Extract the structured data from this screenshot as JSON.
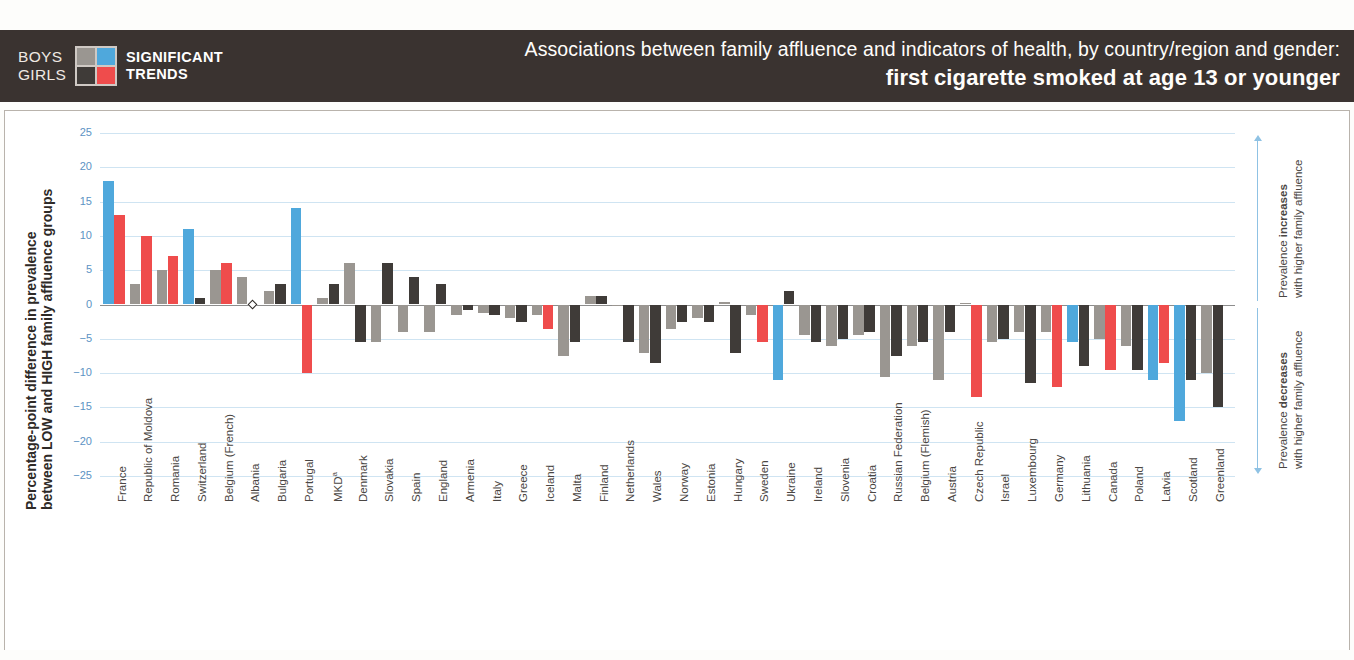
{
  "header": {
    "legend": {
      "boys_label": "BOYS",
      "girls_label": "GIRLS",
      "significant_label": "SIGNIFICANT",
      "trends_label": "TRENDS",
      "boys_color": "#4fa8dc",
      "girls_color": "#ef4c4c",
      "boys_ns_color": "#9a9691",
      "girls_ns_color": "#3f3b38"
    },
    "title_line1": "Associations between family affluence and indicators of health, by country/region and gender:",
    "title_line2": "first cigarette smoked at age 13 or younger",
    "background_color": "#3a3330"
  },
  "axis": {
    "y_caption_line1": "Percentage-point difference in prevalence",
    "y_caption_line2": "between LOW and HIGH family affluence groups",
    "y_ticks": [
      "25",
      "20",
      "15",
      "10",
      "5",
      "0",
      "−5",
      "−10",
      "−15",
      "−20",
      "−25"
    ],
    "y_tick_values": [
      25,
      20,
      15,
      10,
      5,
      0,
      -5,
      -10,
      -15,
      -20,
      -25
    ],
    "ylim": [
      -25,
      25
    ],
    "tick_color": "#5c93c4"
  },
  "annotations": {
    "increase_bold": "increases",
    "increase_pre": "Prevalence ",
    "increase_sub": "with higher family affluence",
    "decrease_bold": "decreases",
    "decrease_pre": "Prevalence ",
    "decrease_sub": "with higher family affluence"
  },
  "chart_data": {
    "type": "bar",
    "title": "Associations between family affluence and indicators of health, by country/region and gender: first cigarette smoked at age 13 or younger",
    "ylabel": "Percentage-point difference in prevalence between LOW and HIGH family affluence groups",
    "xlabel": "",
    "ylim": [
      -25,
      25
    ],
    "grid": true,
    "legend_position": "header",
    "series": [
      {
        "name": "Boys",
        "significant_color": "#4fa8dc",
        "nonsignificant_color": "#9a9691"
      },
      {
        "name": "Girls",
        "significant_color": "#ef4c4c",
        "nonsignificant_color": "#3f3b38"
      }
    ],
    "categories": [
      "France",
      "Republic of Moldova",
      "Romania",
      "Switzerland",
      "Belgium (French)",
      "Albania",
      "Bulgaria",
      "Portugal",
      "MKDᵃ",
      "Denmark",
      "Slovakia",
      "Spain",
      "England",
      "Armenia",
      "Italy",
      "Greece",
      "Iceland",
      "Malta",
      "Finland",
      "Netherlands",
      "Wales",
      "Norway",
      "Estonia",
      "Hungary",
      "Sweden",
      "Ukraine",
      "Ireland",
      "Slovenia",
      "Croatia",
      "Russian Federation",
      "Belgium (Flemish)",
      "Austria",
      "Czech Republic",
      "Israel",
      "Luxembourg",
      "Germany",
      "Lithuania",
      "Canada",
      "Poland",
      "Latvia",
      "Scotland",
      "Greenland"
    ],
    "boys": [
      18.0,
      3.0,
      5.0,
      11.0,
      5.0,
      4.0,
      2.0,
      14.0,
      1.0,
      6.0,
      -5.5,
      -4.0,
      -4.0,
      -1.5,
      -1.2,
      -2.0,
      -1.5,
      -7.5,
      1.2,
      -0.2,
      -7.0,
      -3.5,
      -2.0,
      0.3,
      -1.5,
      -11.0,
      -4.5,
      -6.0,
      -4.5,
      -10.5,
      -6.0,
      -11.0,
      0.2,
      -5.5,
      -4.0,
      -4.0,
      -5.5,
      -5.0,
      -6.0,
      -11.0,
      -17.0,
      -10.0
    ],
    "boys_significant": [
      true,
      false,
      false,
      true,
      false,
      false,
      false,
      true,
      false,
      false,
      false,
      false,
      false,
      false,
      false,
      false,
      false,
      false,
      false,
      false,
      false,
      false,
      false,
      false,
      false,
      true,
      false,
      false,
      false,
      false,
      false,
      false,
      false,
      false,
      false,
      false,
      true,
      false,
      false,
      true,
      true,
      false
    ],
    "girls": [
      13.0,
      10.0,
      7.0,
      1.0,
      6.0,
      0.0,
      3.0,
      -10.0,
      3.0,
      -5.5,
      6.0,
      4.0,
      3.0,
      -0.8,
      -1.5,
      -2.5,
      -3.5,
      -5.5,
      1.3,
      -5.5,
      -8.5,
      -2.5,
      -2.5,
      -7.0,
      -5.5,
      2.0,
      -5.5,
      -5.0,
      -4.0,
      -7.5,
      -5.5,
      -4.0,
      -13.5,
      -5.0,
      -11.5,
      -12.0,
      -9.0,
      -9.5,
      -9.5,
      -8.5,
      -11.0,
      -15.0
    ],
    "girls_significant": [
      true,
      true,
      true,
      false,
      true,
      false,
      false,
      true,
      false,
      false,
      false,
      false,
      false,
      false,
      false,
      false,
      true,
      false,
      false,
      false,
      false,
      false,
      false,
      false,
      true,
      false,
      false,
      false,
      false,
      false,
      false,
      false,
      true,
      false,
      false,
      true,
      false,
      true,
      false,
      true,
      false,
      false
    ],
    "zero_markers": [
      {
        "category": "Albania",
        "gender": "Girls"
      },
      {
        "category": "Netherlands",
        "gender": "Boys"
      },
      {
        "category": "Hungary",
        "gender": "Boys"
      },
      {
        "category": "Czech Republic",
        "gender": "Boys"
      }
    ]
  }
}
